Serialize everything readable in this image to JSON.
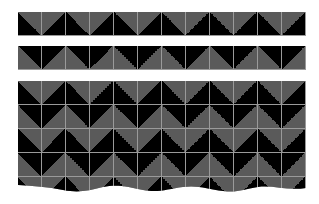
{
  "image": {
    "description": "Chevron / zigzag triangle tile pattern",
    "colors": {
      "dark": "#000000",
      "light": "#5a5a5a",
      "grid": "#9a9a9a",
      "background": "#ffffff"
    },
    "tile_size_px": 24,
    "columns": 12
  },
  "strips": [
    {
      "name": "top-strip-1",
      "pattern": [
        "bl",
        "br"
      ]
    },
    {
      "name": "top-strip-2",
      "pattern": [
        "tr",
        "tl"
      ]
    }
  ],
  "block": {
    "rows": [
      {
        "pattern": [
          "bl",
          "br"
        ]
      },
      {
        "pattern": [
          "tr",
          "tl"
        ]
      },
      {
        "pattern": [
          "bl",
          "br"
        ]
      },
      {
        "pattern": [
          "tr",
          "tl"
        ]
      },
      {
        "pattern": [
          "bl",
          "br"
        ]
      }
    ],
    "bottom_edge": "wavy"
  }
}
